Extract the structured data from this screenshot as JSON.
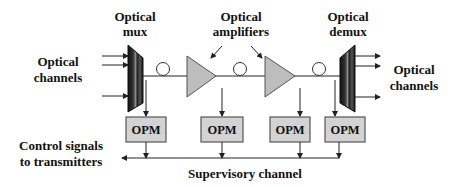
{
  "diagram": {
    "labels": {
      "mux_line1": "Optical",
      "mux_line2": "mux",
      "amplifiers_line1": "Optical",
      "amplifiers_line2": "amplifiers",
      "demux_line1": "Optical",
      "demux_line2": "demux",
      "input_line1": "Optical",
      "input_line2": "channels",
      "output_line1": "Optical",
      "output_line2": "channels",
      "control_line1": "Control signals",
      "control_line2": "to transmitters",
      "supervisory": "Supervisory channel"
    },
    "components": {
      "mux": "Optical mux",
      "amplifiers": [
        "Optical amplifier 1",
        "Optical amplifier 2"
      ],
      "fiber_spools": 3,
      "demux": "Optical demux"
    },
    "opm_boxes": [
      {
        "label": "OPM"
      },
      {
        "label": "OPM"
      },
      {
        "label": "OPM"
      },
      {
        "label": "OPM"
      }
    ],
    "colors": {
      "amplifier_fill": "#bdbdbd",
      "opm_fill": "#d3d3d3",
      "line": "#222222",
      "text": "#111111"
    }
  }
}
